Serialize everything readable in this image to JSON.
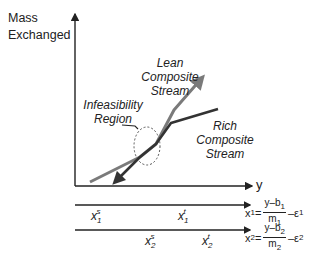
{
  "diagram": {
    "y_axis_title_line1": "Mass",
    "y_axis_title_line2": "Exchanged",
    "x_axis_label": "y",
    "lean_label": [
      "Lean",
      "Composite",
      "Stream"
    ],
    "rich_label": [
      "Rich",
      "Composite",
      "Stream"
    ],
    "infeasibility_label": [
      "Infeasibility",
      "Region"
    ],
    "colors": {
      "lean": "#7a7a7a",
      "rich": "#333333",
      "axis": "#222222",
      "region": "#555555"
    }
  },
  "scales": [
    {
      "axis_var": "x",
      "axis_sub": "1",
      "start_var": "x",
      "start_sub": "1",
      "start_sup": "s",
      "target_var": "x",
      "target_sub": "1",
      "target_sup": "t",
      "eq_lhs": "x",
      "eq_lhs_sub": "1",
      "eq_num": "y–b",
      "eq_num_sub": "1",
      "eq_den": "m",
      "eq_den_sub": "1",
      "eq_tail": "–ε",
      "eq_tail_sub": "1"
    },
    {
      "axis_var": "x",
      "axis_sub": "2",
      "start_var": "x",
      "start_sub": "2",
      "start_sup": "s",
      "target_var": "x",
      "target_sub": "2",
      "target_sup": "t",
      "eq_lhs": "x",
      "eq_lhs_sub": "2",
      "eq_num": "y–b",
      "eq_num_sub": "2",
      "eq_den": "m",
      "eq_den_sub": "2",
      "eq_tail": "–ε",
      "eq_tail_sub": "2"
    }
  ]
}
